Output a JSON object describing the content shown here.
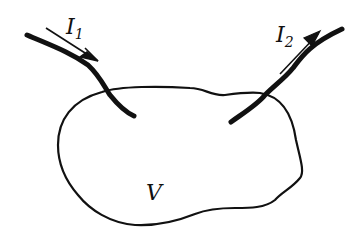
{
  "diagram": {
    "region_label": "V",
    "currents": [
      {
        "symbol": "I",
        "subscript": "1",
        "direction": "into region"
      },
      {
        "symbol": "I",
        "subscript": "2",
        "direction": "out of region"
      }
    ],
    "colors": {
      "ink": "#111111",
      "background": "#ffffff"
    }
  }
}
